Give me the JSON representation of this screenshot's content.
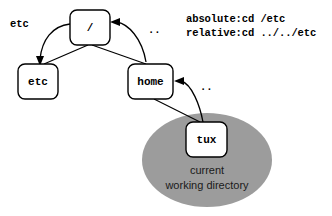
{
  "diagram": {
    "colors": {
      "background": "#ffffff",
      "node_fill": "#ffffff",
      "stroke": "#000000",
      "highlight_ellipse": "#9c9c9c",
      "caption_text": "#1a1a1a"
    },
    "nodes": [
      {
        "id": "root",
        "label": "/",
        "x": 90,
        "y": 27
      },
      {
        "id": "etc",
        "label": "etc",
        "x": 38,
        "y": 81
      },
      {
        "id": "home",
        "label": "home",
        "x": 150,
        "y": 81
      },
      {
        "id": "tux",
        "label": "tux",
        "x": 206,
        "y": 139
      }
    ],
    "edges": [
      {
        "from": "root",
        "to": "etc",
        "kind": "tree"
      },
      {
        "from": "root",
        "to": "home",
        "kind": "tree"
      },
      {
        "from": "home",
        "to": "tux",
        "kind": "tree"
      }
    ],
    "navigation_arrows": [
      {
        "id": "root-to-etc",
        "label": "etc",
        "from": "root",
        "to": "etc",
        "label_x": 10,
        "label_y": 27
      },
      {
        "id": "home-to-root",
        "label": "..",
        "from": "home",
        "to": "root",
        "label_x": 148,
        "label_y": 33
      },
      {
        "id": "tux-to-home",
        "label": "..",
        "from": "tux",
        "to": "home",
        "label_x": 200,
        "label_y": 90
      }
    ],
    "commands": {
      "absolute": "absolute:cd /etc",
      "relative": "relative:cd ../../etc"
    },
    "cwd_marker": {
      "caption_line1": "current",
      "caption_line2": "working directory",
      "center_x": 207,
      "center_y": 160,
      "radius_x": 65,
      "radius_y": 47
    }
  }
}
